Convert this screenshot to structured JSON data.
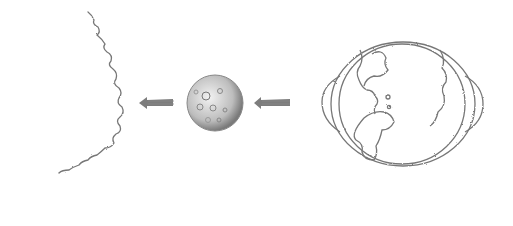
{
  "scene": {
    "description": "Pencil sketch: sun edge, moon, and earth with arrows pointing left",
    "objects": [
      {
        "name": "sun",
        "label": "sun edge"
      },
      {
        "name": "arrow-1",
        "label": "arrow pointing left toward sun"
      },
      {
        "name": "moon",
        "label": "moon"
      },
      {
        "name": "arrow-2",
        "label": "arrow pointing left toward moon"
      },
      {
        "name": "earth",
        "label": "earth"
      }
    ],
    "colors": {
      "pencil": "#6a6a6a",
      "dark": "#444444",
      "paper": "#ffffff"
    }
  }
}
